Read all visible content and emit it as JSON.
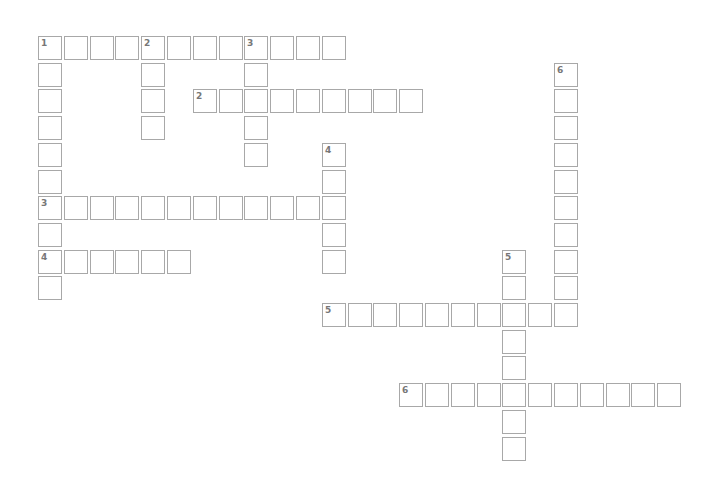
{
  "puzzle": {
    "origin": {
      "x": 38,
      "y": 36
    },
    "pitch": {
      "x": 25.8,
      "y": 26.7
    },
    "entries": [
      {
        "number": "1",
        "direction": "across",
        "row": 0,
        "col": 0,
        "length": 12
      },
      {
        "number": "1",
        "direction": "down",
        "row": 0,
        "col": 0,
        "length": 10
      },
      {
        "number": "2",
        "direction": "down",
        "row": 0,
        "col": 4,
        "length": 4
      },
      {
        "number": "3",
        "direction": "down",
        "row": 0,
        "col": 8,
        "length": 5
      },
      {
        "number": "2",
        "direction": "across",
        "row": 2,
        "col": 6,
        "length": 9
      },
      {
        "number": "6",
        "direction": "down",
        "row": 1,
        "col": 20,
        "length": 10
      },
      {
        "number": "4",
        "direction": "down",
        "row": 4,
        "col": 11,
        "length": 5
      },
      {
        "number": "3",
        "direction": "across",
        "row": 6,
        "col": 0,
        "length": 12
      },
      {
        "number": "4",
        "direction": "across",
        "row": 8,
        "col": 0,
        "length": 6
      },
      {
        "number": "5",
        "direction": "down",
        "row": 8,
        "col": 18,
        "length": 8
      },
      {
        "number": "5",
        "direction": "across",
        "row": 10,
        "col": 11,
        "length": 10
      },
      {
        "number": "6",
        "direction": "across",
        "row": 13,
        "col": 14,
        "length": 11
      }
    ]
  }
}
